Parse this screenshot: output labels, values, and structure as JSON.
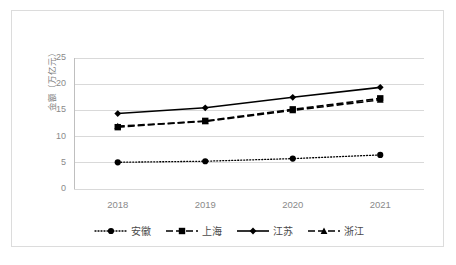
{
  "chart_data": {
    "type": "line",
    "title": "",
    "xlabel": "",
    "ylabel": "金额（万亿元）",
    "categories": [
      "2018",
      "2019",
      "2020",
      "2021"
    ],
    "ylim": [
      0,
      25
    ],
    "yticks": [
      0,
      5,
      10,
      15,
      20,
      25
    ],
    "grid": true,
    "legend_position": "bottom",
    "series": [
      {
        "name": "安徽",
        "values": [
          5.1,
          5.3,
          5.8,
          6.5
        ],
        "marker": "circle",
        "linestyle": "dotted",
        "color": "#000000"
      },
      {
        "name": "上海",
        "values": [
          11.8,
          13.0,
          15.2,
          17.3
        ],
        "marker": "square",
        "linestyle": "dashed",
        "color": "#000000"
      },
      {
        "name": "江苏",
        "values": [
          14.4,
          15.5,
          17.5,
          19.4
        ],
        "marker": "diamond",
        "linestyle": "solid",
        "color": "#000000"
      },
      {
        "name": "浙江",
        "values": [
          12.0,
          12.9,
          15.0,
          17.0
        ],
        "marker": "triangle",
        "linestyle": "dashed",
        "color": "#000000"
      }
    ]
  },
  "axis": {
    "y_tick_labels": [
      "25",
      "20",
      "15",
      "10",
      "5",
      "0"
    ],
    "x_tick_labels": [
      "2018",
      "2019",
      "2020",
      "2021"
    ],
    "y_title": "金额（万亿元）"
  },
  "legend": {
    "items": [
      {
        "label": "安徽"
      },
      {
        "label": "上海"
      },
      {
        "label": "江苏"
      },
      {
        "label": "浙江"
      }
    ]
  },
  "style": {
    "grid_color": "#d9d9d9",
    "border_color": "#dcdcdc",
    "tick_text_color": "#8a8a8a",
    "series_color": "#000000",
    "background": "#ffffff"
  }
}
